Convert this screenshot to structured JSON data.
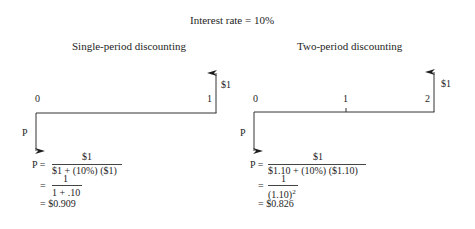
{
  "title": "Interest rate = 10%",
  "left": {
    "heading": "Single-period discounting",
    "timeline": {
      "labels": [
        "0",
        "1"
      ],
      "future_value": "$1",
      "present_label": "P"
    },
    "formula": {
      "line1_lhs": "P =",
      "line1_num": "$1",
      "line1_den": "$1 + (10%) ($1)",
      "line2_eq": "=",
      "line2_num": "1",
      "line2_den": "1 + .10",
      "line3": "= $0.909"
    }
  },
  "right": {
    "heading": "Two-period discounting",
    "timeline": {
      "labels": [
        "0",
        "1",
        "2"
      ],
      "future_value": "$1",
      "present_label": "P"
    },
    "formula": {
      "line1_lhs": "P =",
      "line1_num": "$1",
      "line1_den": "$1.10 + (10%) ($1.10)",
      "line2_eq": "=",
      "line2_num": "1",
      "line2_den_base": "(1.10)",
      "line2_den_exp": "2",
      "line3": "= $0.826"
    }
  }
}
